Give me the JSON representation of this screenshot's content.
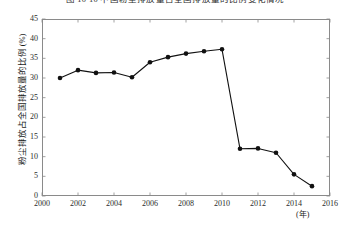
{
  "figure": {
    "caption": "图 10-10  中国粉尘排放量占全国排放量的比例变化情况"
  },
  "chart_data": {
    "type": "line",
    "title": "图 10-10  中国粉尘排放量占全国排放量的比例变化情况",
    "xlabel": "(年)",
    "ylabel": "粉尘排放占全国排放量的比例 (%)",
    "xlim": [
      2000,
      2016
    ],
    "ylim": [
      0,
      45
    ],
    "xticks": [
      2000,
      2002,
      2004,
      2006,
      2008,
      2010,
      2012,
      2014,
      2016
    ],
    "yticks": [
      0,
      5,
      10,
      15,
      20,
      25,
      30,
      35,
      40,
      45
    ],
    "grid": false,
    "legend": null,
    "marker": "filled-circle",
    "line_color": "#111111",
    "x": [
      2001,
      2002,
      2003,
      2004,
      2005,
      2006,
      2007,
      2008,
      2009,
      2010,
      2011,
      2012,
      2013,
      2014,
      2015
    ],
    "values": [
      30.0,
      32.0,
      31.3,
      31.4,
      30.2,
      34.0,
      35.3,
      36.2,
      36.8,
      37.3,
      12.0,
      12.1,
      11.0,
      5.5,
      2.5
    ],
    "series": [
      {
        "name": "粉尘排放占全国排放量的比例",
        "values": [
          30.0,
          32.0,
          31.3,
          31.4,
          30.2,
          34.0,
          35.3,
          36.2,
          36.8,
          37.3,
          12.0,
          12.1,
          11.0,
          5.5,
          2.5
        ]
      }
    ]
  },
  "axes": {
    "y_tick_labels": [
      "45",
      "40",
      "35",
      "30",
      "25",
      "20",
      "15",
      "10",
      "5",
      "0"
    ],
    "x_tick_labels": [
      "2000",
      "2002",
      "2004",
      "2006",
      "2008",
      "2010",
      "2012",
      "2014",
      "2016"
    ],
    "y_title": "粉尘排放占全国排放量的比例 (%)",
    "x_title": "(年)"
  }
}
